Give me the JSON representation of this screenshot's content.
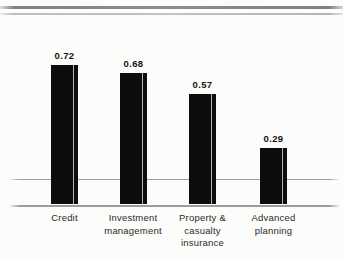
{
  "chart_data": {
    "type": "bar",
    "title": "",
    "xlabel": "",
    "ylabel": "",
    "categories": [
      "Credit",
      "Investment management",
      "Property & casualty insurance",
      "Advanced planning"
    ],
    "values": [
      0.72,
      0.68,
      0.57,
      0.29
    ],
    "value_labels": [
      "0.72",
      "0.68",
      "0.57",
      "0.29"
    ],
    "categories_lines": [
      [
        "Credit"
      ],
      [
        "Investment",
        "management"
      ],
      [
        "Property &",
        "casualty",
        "insurance"
      ],
      [
        "Advanced",
        "planning"
      ]
    ],
    "ylim": [
      0,
      0.8
    ],
    "legend": "none",
    "grid": "one horizontal gridline above baseline",
    "bar_color": "#0d0d0d",
    "axis_line_color": "#9d9d9d",
    "background_color": "#fcfcfa"
  }
}
